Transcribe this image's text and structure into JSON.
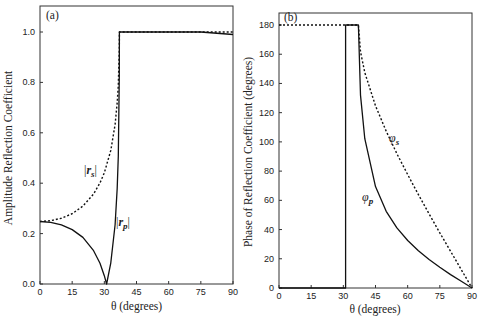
{
  "chart_data": [
    {
      "type": "line",
      "panel_label": "(a)",
      "title": "",
      "xlabel": "θ (degrees)",
      "ylabel": "Amplitude Reflection Coefficient",
      "xlim": [
        0,
        90
      ],
      "ylim": [
        0,
        1.1
      ],
      "xticks": [
        0,
        15,
        30,
        45,
        60,
        75,
        90
      ],
      "xtick_labels": [
        "0",
        "15",
        "30",
        "45",
        "60",
        "75",
        "90"
      ],
      "yticks": [
        0.0,
        0.2,
        0.4,
        0.6,
        0.8,
        1.0
      ],
      "ytick_labels": [
        "0.0",
        "0.2",
        "0.4",
        "0.6",
        "0.8",
        "1.0"
      ],
      "grid": false,
      "series": [
        {
          "name": "|r_s|",
          "label_main": "|r",
          "label_sub": "s",
          "style": "dotted",
          "x": [
            0,
            5,
            10,
            15,
            20,
            25,
            28,
            30,
            33,
            35,
            36,
            36.5,
            37,
            37.04,
            45,
            60,
            75,
            90
          ],
          "y": [
            0.248,
            0.251,
            0.261,
            0.279,
            0.309,
            0.357,
            0.401,
            0.441,
            0.53,
            0.633,
            0.72,
            0.788,
            0.935,
            1.0,
            1.0,
            1.0,
            1.0,
            1.0
          ]
        },
        {
          "name": "|r_p|",
          "label_main": "|r",
          "label_sub": "p",
          "style": "solid",
          "x": [
            0,
            5,
            10,
            15,
            20,
            25,
            28,
            30,
            31.06,
            33,
            35,
            36,
            36.5,
            37,
            37.04,
            45,
            60,
            75,
            90
          ],
          "y": [
            0.248,
            0.245,
            0.235,
            0.216,
            0.185,
            0.132,
            0.082,
            0.033,
            0.0,
            0.084,
            0.235,
            0.38,
            0.507,
            0.83,
            1.0,
            1.0,
            1.0,
            1.0,
            0.99
          ]
        }
      ]
    },
    {
      "type": "line",
      "panel_label": "(b)",
      "title": "",
      "xlabel": "θ (degrees)",
      "ylabel": "Phase of Reflection Coefficient (degrees)",
      "xlim": [
        0,
        90
      ],
      "ylim": [
        0,
        190
      ],
      "xticks": [
        0,
        15,
        30,
        45,
        60,
        75,
        90
      ],
      "xtick_labels": [
        "0",
        "15",
        "30",
        "45",
        "60",
        "75",
        "90"
      ],
      "yticks": [
        0,
        20,
        40,
        60,
        80,
        100,
        120,
        140,
        160,
        180
      ],
      "ytick_labels": [
        "0",
        "20",
        "40",
        "60",
        "80",
        "100",
        "120",
        "140",
        "160",
        "180"
      ],
      "grid": false,
      "series": [
        {
          "name": "φ_s",
          "label_main": "φ",
          "label_sub": "s",
          "style": "dotted",
          "x": [
            0,
            31.06,
            37.04,
            38,
            40,
            45,
            50,
            55,
            60,
            65,
            70,
            75,
            80,
            85,
            90
          ],
          "y": [
            180,
            180,
            180,
            161.7,
            147.4,
            124.7,
            107.3,
            91.9,
            77.6,
            63.9,
            50.7,
            37.8,
            25.1,
            12.5,
            0
          ]
        },
        {
          "name": "φ_p",
          "label_main": "φ",
          "label_sub": "p",
          "style": "solid",
          "x": [
            0,
            31.06,
            31.06,
            37.04,
            38,
            40,
            45,
            50,
            55,
            60,
            65,
            70,
            75,
            80,
            85,
            90
          ],
          "y": [
            0,
            0,
            180,
            180,
            132.0,
            102.2,
            69.4,
            52.5,
            41.1,
            32.5,
            25.5,
            19.5,
            14.2,
            9.2,
            4.6,
            0
          ]
        }
      ]
    }
  ]
}
